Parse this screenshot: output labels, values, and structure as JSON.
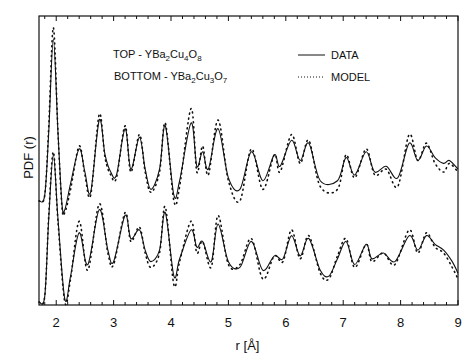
{
  "chart_data": {
    "type": "line",
    "title": "",
    "xlabel": "r [Å]",
    "ylabel": "PDF (r)",
    "xlim": [
      1.7,
      9
    ],
    "ylim": [
      0,
      100
    ],
    "xticks": [
      2,
      3,
      4,
      5,
      6,
      7,
      8,
      9
    ],
    "minor_ticks_per_major": 5,
    "grid": false,
    "annotations": [
      {
        "text_parts": [
          "TOP - YBa",
          "2",
          "Cu",
          "4",
          "O",
          "8"
        ],
        "label": "TOP - YBa2Cu4O8"
      },
      {
        "text_parts": [
          "BOTTOM - YBa",
          "2",
          "Cu",
          "3",
          "O",
          "7"
        ],
        "label": "BOTTOM - YBa2Cu3O7"
      }
    ],
    "legend": [
      {
        "label": "DATA",
        "style": "solid"
      },
      {
        "label": "MODEL",
        "style": "dotted"
      }
    ],
    "legend_position": "upper right",
    "series": [
      {
        "name": "TOP - YBa2Cu4O8 DATA",
        "style": "solid",
        "x": [
          1.7,
          1.8,
          1.87,
          1.95,
          2.03,
          2.1,
          2.15,
          2.25,
          2.4,
          2.5,
          2.6,
          2.75,
          2.85,
          2.95,
          3.05,
          3.2,
          3.3,
          3.45,
          3.55,
          3.65,
          3.8,
          3.9,
          4.05,
          4.15,
          4.35,
          4.45,
          4.55,
          4.65,
          4.82,
          5.0,
          5.2,
          5.4,
          5.6,
          5.8,
          5.9,
          6.1,
          6.25,
          6.4,
          6.6,
          6.9,
          7.05,
          7.2,
          7.4,
          7.55,
          7.75,
          7.95,
          8.15,
          8.3,
          8.45,
          8.6,
          8.75,
          8.85,
          9.0
        ],
        "y": [
          36,
          38,
          60,
          92,
          60,
          35,
          33,
          42,
          54,
          46,
          39,
          64,
          52,
          46,
          45,
          61,
          47,
          58,
          47,
          40,
          47,
          62,
          38,
          43,
          63,
          48,
          53,
          47,
          61,
          44,
          40,
          53,
          43,
          52,
          48,
          57,
          50,
          56,
          43,
          43,
          51,
          45,
          53,
          46,
          48,
          44,
          56,
          50,
          55,
          51,
          49,
          50,
          47
        ]
      },
      {
        "name": "TOP - YBa2Cu4O8 MODEL",
        "style": "dotted",
        "x": [
          1.7,
          1.8,
          1.87,
          1.95,
          2.03,
          2.1,
          2.15,
          2.25,
          2.4,
          2.5,
          2.6,
          2.75,
          2.85,
          2.95,
          3.05,
          3.2,
          3.3,
          3.45,
          3.55,
          3.65,
          3.8,
          3.9,
          4.05,
          4.15,
          4.35,
          4.45,
          4.55,
          4.65,
          4.82,
          5.0,
          5.2,
          5.4,
          5.6,
          5.8,
          5.9,
          6.1,
          6.25,
          6.4,
          6.6,
          6.9,
          7.05,
          7.2,
          7.4,
          7.55,
          7.75,
          7.95,
          8.15,
          8.3,
          8.45,
          8.6,
          8.75,
          8.85,
          9.0
        ],
        "y": [
          36,
          38,
          62,
          96,
          60,
          34,
          32,
          40,
          55,
          45,
          38,
          66,
          51,
          45,
          44,
          62,
          46,
          59,
          46,
          39,
          46,
          63,
          36,
          41,
          68,
          46,
          55,
          45,
          64,
          43,
          36,
          54,
          40,
          52,
          46,
          59,
          49,
          57,
          41,
          40,
          52,
          44,
          54,
          45,
          47,
          41,
          59,
          50,
          56,
          49,
          46,
          49,
          46
        ]
      },
      {
        "name": "BOTTOM - YBa2Cu3O7 DATA",
        "style": "solid",
        "x": [
          1.7,
          1.8,
          1.87,
          1.95,
          2.03,
          2.15,
          2.25,
          2.4,
          2.55,
          2.75,
          2.9,
          3.0,
          3.2,
          3.3,
          3.45,
          3.55,
          3.65,
          3.8,
          3.9,
          4.05,
          4.15,
          4.35,
          4.45,
          4.55,
          4.7,
          4.82,
          5.0,
          5.2,
          5.4,
          5.6,
          5.8,
          5.95,
          6.1,
          6.25,
          6.4,
          6.6,
          6.75,
          6.9,
          7.05,
          7.2,
          7.4,
          7.5,
          7.7,
          7.9,
          8.15,
          8.3,
          8.45,
          8.6,
          8.75,
          8.9,
          9.0
        ],
        "y": [
          1,
          3,
          30,
          52,
          30,
          2,
          10,
          25,
          14,
          33,
          19,
          15,
          31,
          23,
          26,
          19,
          15,
          19,
          32,
          10,
          16,
          26,
          20,
          22,
          15,
          28,
          15,
          13,
          22,
          12,
          17,
          16,
          24,
          17,
          23,
          12,
          10,
          16,
          22,
          14,
          21,
          16,
          18,
          15,
          24,
          19,
          24,
          21,
          19,
          15,
          11
        ]
      },
      {
        "name": "BOTTOM - YBa2Cu3O7 MODEL",
        "style": "dotted",
        "x": [
          1.7,
          1.8,
          1.87,
          1.95,
          2.03,
          2.15,
          2.25,
          2.4,
          2.55,
          2.75,
          2.9,
          3.0,
          3.2,
          3.3,
          3.45,
          3.55,
          3.65,
          3.8,
          3.9,
          4.05,
          4.15,
          4.35,
          4.45,
          4.55,
          4.7,
          4.82,
          5.0,
          5.2,
          5.4,
          5.6,
          5.8,
          5.95,
          6.1,
          6.25,
          6.4,
          6.6,
          6.75,
          6.9,
          7.05,
          7.2,
          7.4,
          7.5,
          7.7,
          7.9,
          8.15,
          8.3,
          8.45,
          8.6,
          8.75,
          8.9,
          9.0
        ],
        "y": [
          1,
          3,
          31,
          53,
          29,
          1,
          9,
          29,
          12,
          35,
          18,
          14,
          32,
          22,
          27,
          18,
          13,
          18,
          34,
          7,
          15,
          29,
          18,
          22,
          13,
          31,
          14,
          14,
          23,
          9,
          17,
          15,
          26,
          16,
          24,
          11,
          9,
          17,
          23,
          13,
          21,
          15,
          18,
          14,
          26,
          18,
          25,
          20,
          18,
          13,
          9
        ]
      }
    ]
  }
}
